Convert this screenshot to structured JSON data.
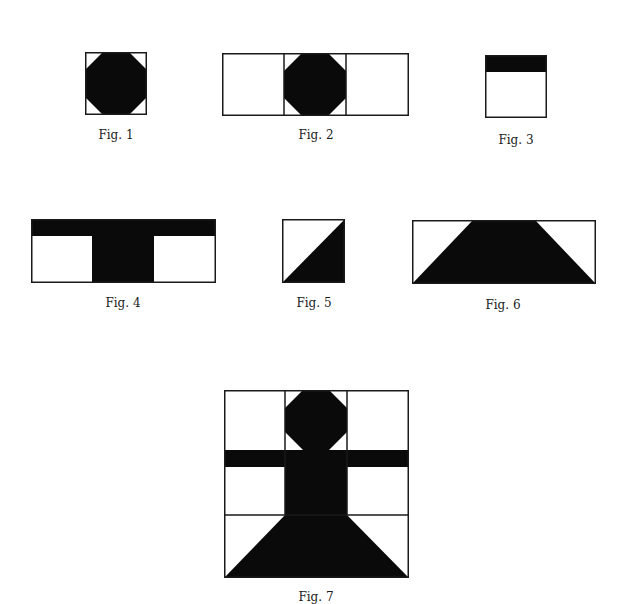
{
  "colors": {
    "ink": "#0a0a0a",
    "paper": "#ffffff",
    "line": "#1a1a1a"
  },
  "figures": [
    {
      "id": "fig1",
      "caption": "Fig. 1",
      "shape": "octagon-in-square"
    },
    {
      "id": "fig2",
      "caption": "Fig. 2",
      "shape": "three-squares-center-octagon"
    },
    {
      "id": "fig3",
      "caption": "Fig. 3",
      "shape": "square-with-top-band"
    },
    {
      "id": "fig4",
      "caption": "Fig. 4",
      "shape": "t-shape-three-squares"
    },
    {
      "id": "fig5",
      "caption": "Fig. 5",
      "shape": "square-diagonal-half"
    },
    {
      "id": "fig6",
      "caption": "Fig. 6",
      "shape": "trapezoid-in-rectangle"
    },
    {
      "id": "fig7",
      "caption": "Fig. 7",
      "shape": "figure-composite-3x3"
    }
  ]
}
